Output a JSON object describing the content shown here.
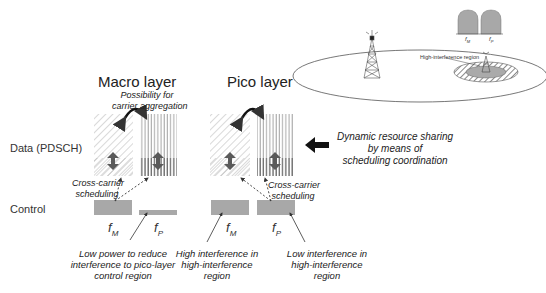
{
  "diagram": {
    "layers": [
      {
        "title": "Macro layer",
        "carrier_note": "Possibility for\ncarrier aggregation",
        "freq_labels": [
          "f",
          "f"
        ],
        "freq_subs": [
          "M",
          "P"
        ]
      },
      {
        "title": "Pico layer",
        "freq_labels": [
          "f",
          "f"
        ],
        "freq_subs": [
          "M",
          "P"
        ]
      }
    ],
    "row_labels": {
      "data": "Data (PDSCH)",
      "control": "Control"
    },
    "carrier_note_line1": "Possibility for",
    "carrier_note_line2": "carrier aggregation",
    "cross_carrier": {
      "line1": "Cross-carrier",
      "line2": "scheduling"
    },
    "dynamic_sharing": {
      "line1": "Dynamic resource sharing",
      "line2": "by means of",
      "line3": "scheduling coordination"
    },
    "annotations": {
      "macro_fp": {
        "line1": "Low power to reduce",
        "line2": "interference to pico-layer",
        "line3": "control region"
      },
      "pico_fm": {
        "line1": "High interference in",
        "line2": "high-interference",
        "line3": "region"
      },
      "pico_fp": {
        "line1": "Low interference in",
        "line2": "high-interference",
        "line3": "region"
      }
    },
    "inset": {
      "region_label": "High-interference region",
      "spectrum_labels": {
        "fm": "f",
        "fm_sub": "M",
        "fp": "f",
        "fp_sub": "P"
      }
    },
    "colors": {
      "block": "#a8a8a8",
      "arrow": "#5a5a5a",
      "hatch": "#9a9a9a"
    }
  }
}
